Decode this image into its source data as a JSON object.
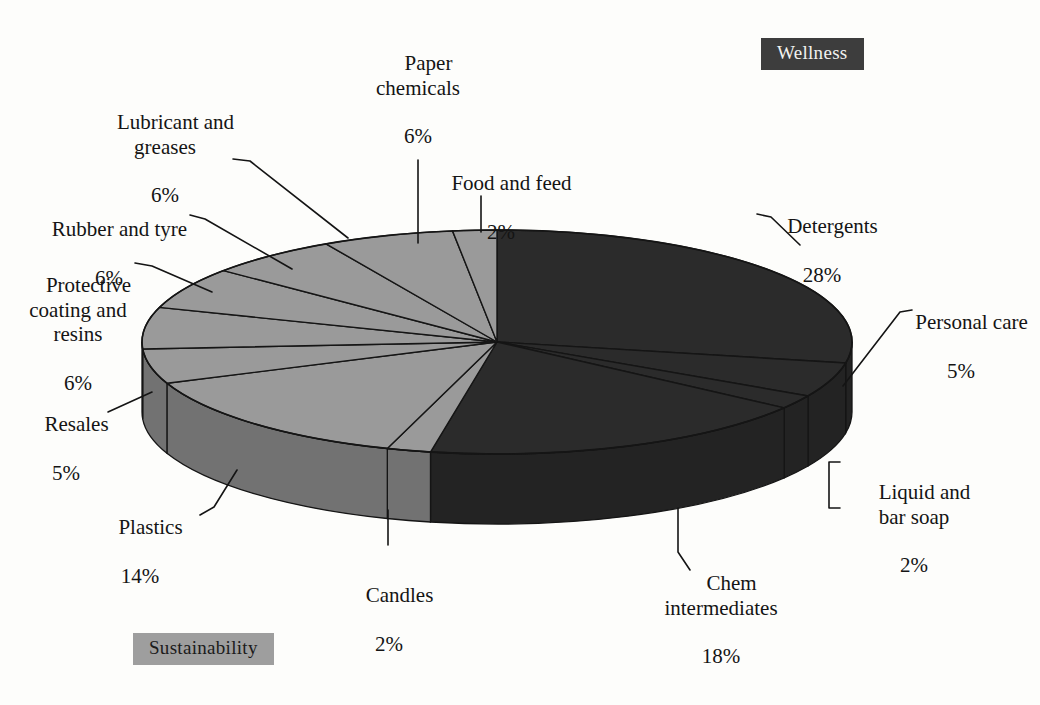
{
  "tags": {
    "wellness": {
      "label": "Wellness",
      "color": "#3d3d3d",
      "text_color": "#f2f2f0"
    },
    "sustainability": {
      "label": "Sustainability",
      "color": "#9e9e9e",
      "text_color": "#1b1b1b"
    }
  },
  "palette": {
    "dark_slice": "#2b2b2b",
    "light_slice": "#9a9a9a",
    "dark_side": "#232323",
    "light_side": "#6f6f6f",
    "outline": "#151515",
    "background": "#fdfdfb"
  },
  "chart_data": {
    "type": "pie",
    "title": "",
    "subtitle": "",
    "xlabel": "",
    "ylabel": "",
    "three_d": true,
    "total": 100,
    "units": "%",
    "legend_position": "none",
    "labels_outside": true,
    "categories": [
      "Detergents",
      "Personal care",
      "Liquid and bar soap",
      "Chem intermediates",
      "Candles",
      "Plastics",
      "Resales",
      "Protective coating and resins",
      "Rubber and tyre",
      "Lubricant and greases",
      "Paper chemicals",
      "Food and feed"
    ],
    "values": [
      28,
      5,
      2,
      18,
      2,
      14,
      5,
      6,
      6,
      6,
      6,
      2
    ],
    "slices": [
      {
        "name": "Detergents",
        "value": 28,
        "display": "28%",
        "group": "Wellness",
        "color": "#2b2b2b"
      },
      {
        "name": "Personal care",
        "value": 5,
        "display": "5%",
        "group": "Wellness",
        "color": "#2b2b2b"
      },
      {
        "name": "Liquid and bar soap",
        "value": 2,
        "display": "2%",
        "group": "Wellness",
        "color": "#2b2b2b"
      },
      {
        "name": "Chem intermediates",
        "value": 18,
        "display": "18%",
        "group": "Wellness",
        "color": "#2b2b2b"
      },
      {
        "name": "Candles",
        "value": 2,
        "display": "2%",
        "group": "Sustainability",
        "color": "#9a9a9a"
      },
      {
        "name": "Plastics",
        "value": 14,
        "display": "14%",
        "group": "Sustainability",
        "color": "#9a9a9a"
      },
      {
        "name": "Resales",
        "value": 5,
        "display": "5%",
        "group": "Sustainability",
        "color": "#9a9a9a"
      },
      {
        "name": "Protective coating and resins",
        "value": 6,
        "display": "6%",
        "group": "Sustainability",
        "color": "#9a9a9a"
      },
      {
        "name": "Rubber and tyre",
        "value": 6,
        "display": "6%",
        "group": "Sustainability",
        "color": "#9a9a9a"
      },
      {
        "name": "Lubricant and greases",
        "value": 6,
        "display": "6%",
        "group": "Sustainability",
        "color": "#9a9a9a"
      },
      {
        "name": "Paper chemicals",
        "value": 6,
        "display": "6%",
        "group": "Sustainability",
        "color": "#9a9a9a"
      },
      {
        "name": "Food and feed",
        "value": 2,
        "display": "2%",
        "group": "Sustainability",
        "color": "#9a9a9a"
      }
    ]
  },
  "labels": {
    "paper_chemicals": {
      "name": "Paper\nchemicals",
      "pct": "6%"
    },
    "lubricant_greases": {
      "name": "Lubricant and\ngreases",
      "pct": "6%"
    },
    "food_and_feed": {
      "name": "Food and feed",
      "pct": "2%"
    },
    "rubber_and_tyre": {
      "name": "Rubber and tyre",
      "pct": "6%"
    },
    "protective_coating": {
      "name": "Protective\ncoating and\nresins",
      "pct": "6%"
    },
    "resales": {
      "name": "Resales",
      "pct": "5%"
    },
    "plastics": {
      "name": "Plastics",
      "pct": "14%"
    },
    "candles": {
      "name": "Candles",
      "pct": "2%"
    },
    "chem_intermediates": {
      "name": "Chem\nintermediates",
      "pct": "18%"
    },
    "detergents": {
      "name": "Detergents",
      "pct": "28%"
    },
    "personal_care": {
      "name": "Personal care",
      "pct": "5%"
    },
    "liquid_bar_soap": {
      "name": "Liquid and\nbar soap",
      "pct": "2%"
    }
  }
}
